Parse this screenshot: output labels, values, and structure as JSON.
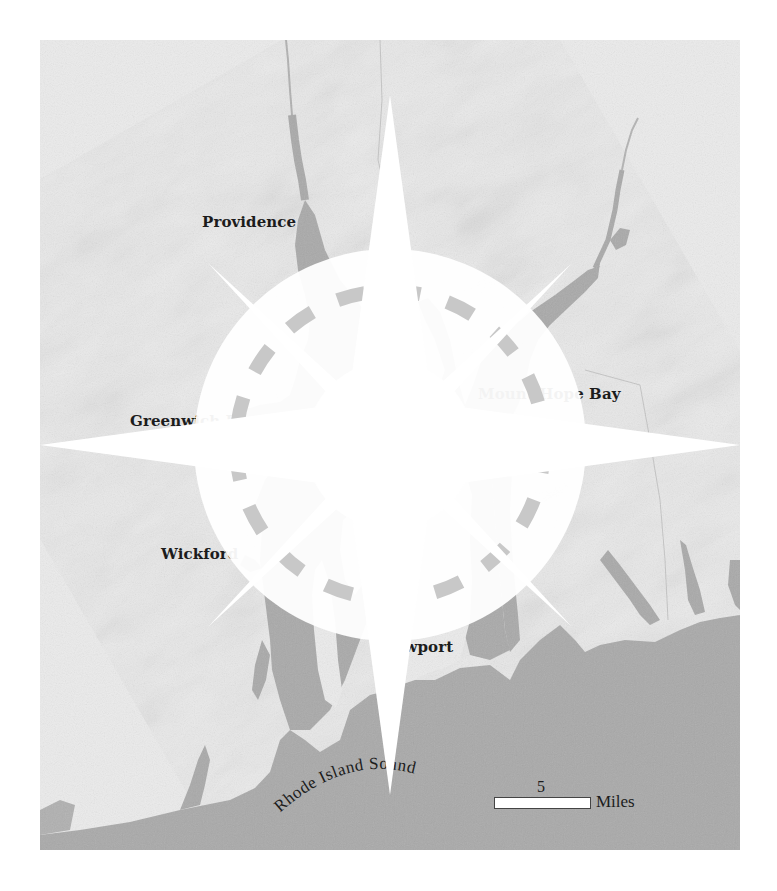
{
  "map": {
    "colors": {
      "land": "#e9e9e9",
      "land_shade": "#d9d9d9",
      "water": "#a9a9a9",
      "water_dark": "#9d9d9d",
      "label": "#1c1c1c",
      "background": "#ffffff"
    },
    "labels": [
      {
        "id": "providence",
        "text": "Providence"
      },
      {
        "id": "greenwich-bay",
        "text": "Greenwich Bay"
      },
      {
        "id": "wickford",
        "text": "Wickford"
      },
      {
        "id": "mount-hope-bay",
        "text": "Mount Hope Bay"
      },
      {
        "id": "newport",
        "text": "Newport"
      }
    ],
    "water_label": {
      "text": "Rhode Island Sound"
    },
    "scale": {
      "value": "5",
      "unit": "Miles"
    },
    "compass": {
      "icon": "compass-rose-icon"
    }
  }
}
